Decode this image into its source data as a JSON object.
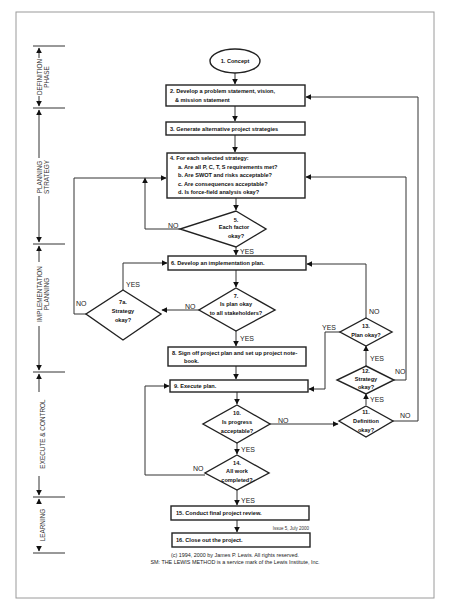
{
  "diagram": {
    "type": "flowchart",
    "phases": [
      {
        "id": "definition",
        "lines": [
          "DEFINITION",
          "PHASE"
        ]
      },
      {
        "id": "planning-strategy",
        "lines": [
          "PLANNING",
          "STRATEGY"
        ]
      },
      {
        "id": "implementation-planning",
        "lines": [
          "IMPLEMENTATION",
          "PLANNING"
        ]
      },
      {
        "id": "execute-control",
        "lines": [
          "EXECUTE & CONTROL"
        ]
      },
      {
        "id": "learning",
        "lines": [
          "LEARNING"
        ]
      }
    ],
    "nodes": {
      "n1": {
        "shape": "ellipse",
        "text": "1. Concept"
      },
      "n2": {
        "shape": "rect",
        "lines": [
          "2. Develop a problem statement, vision,",
          "& mission  statement"
        ]
      },
      "n3": {
        "shape": "rect",
        "lines": [
          "3. Generate alternative project strategies"
        ]
      },
      "n4": {
        "shape": "rect",
        "lines": [
          "4. For each selected strategy:",
          "a. Are all P, C, T, S requirements met?",
          "b. Are SWOT and risks acceptable?",
          "c. Are consequences acceptable?",
          "d. Is force-field analysis okay?"
        ]
      },
      "n5": {
        "shape": "diamond",
        "lines": [
          "5.",
          "Each factor",
          "okay?"
        ]
      },
      "n6": {
        "shape": "rect",
        "lines": [
          "6. Develop an implementation plan."
        ]
      },
      "n7": {
        "shape": "diamond",
        "lines": [
          "7.",
          "Is  plan okay",
          "to all stakeholders?"
        ]
      },
      "n7a": {
        "shape": "diamond",
        "lines": [
          "7a.",
          "Strategy",
          "okay?"
        ]
      },
      "n8": {
        "shape": "rect",
        "lines": [
          "8. Sign off project plan and set up project note-",
          "book."
        ]
      },
      "n9": {
        "shape": "rect",
        "lines": [
          "9. Execute plan."
        ]
      },
      "n10": {
        "shape": "diamond",
        "lines": [
          "10.",
          "Is progress",
          "acceptable?"
        ]
      },
      "n11": {
        "shape": "diamond",
        "lines": [
          "11.",
          "Definition",
          "okay?"
        ]
      },
      "n12": {
        "shape": "diamond",
        "lines": [
          "12.",
          "Strategy",
          "okay?"
        ]
      },
      "n13": {
        "shape": "diamond",
        "lines": [
          "13.",
          "Plan okay?"
        ]
      },
      "n14": {
        "shape": "diamond",
        "lines": [
          "14.",
          "All work",
          "completed?"
        ]
      },
      "n15": {
        "shape": "rect",
        "lines": [
          "15. Conduct final project review."
        ]
      },
      "n16": {
        "shape": "rect",
        "lines": [
          "16. Close out the project."
        ]
      }
    },
    "edge_labels": {
      "yes": "YES",
      "no": "NO"
    },
    "edges": [
      {
        "from": "n1",
        "to": "n2"
      },
      {
        "from": "n2",
        "to": "n3"
      },
      {
        "from": "n3",
        "to": "n4"
      },
      {
        "from": "n4",
        "to": "n5"
      },
      {
        "from": "n5",
        "to": "n6",
        "label": "YES"
      },
      {
        "from": "n5",
        "to": "n4",
        "label": "NO"
      },
      {
        "from": "n6",
        "to": "n7"
      },
      {
        "from": "n7",
        "to": "n8",
        "label": "YES"
      },
      {
        "from": "n7",
        "to": "n7a",
        "label": "NO"
      },
      {
        "from": "n7a",
        "to": "n6",
        "label": "YES"
      },
      {
        "from": "n7a",
        "to": "n4",
        "label": "NO"
      },
      {
        "from": "n8",
        "to": "n9"
      },
      {
        "from": "n9",
        "to": "n10"
      },
      {
        "from": "n10",
        "to": "n14",
        "label": "YES"
      },
      {
        "from": "n10",
        "to": "n11",
        "label": "NO"
      },
      {
        "from": "n11",
        "to": "n12",
        "label": "YES"
      },
      {
        "from": "n11",
        "to": "n2",
        "label": "NO"
      },
      {
        "from": "n12",
        "to": "n13",
        "label": "YES"
      },
      {
        "from": "n12",
        "to": "n4",
        "label": "NO"
      },
      {
        "from": "n13",
        "to": "n9",
        "label": "YES"
      },
      {
        "from": "n13",
        "to": "n6",
        "label": "NO"
      },
      {
        "from": "n14",
        "to": "n15",
        "label": "YES"
      },
      {
        "from": "n14",
        "to": "n9",
        "label": "NO"
      },
      {
        "from": "n15",
        "to": "n16"
      }
    ],
    "issue_note": "Issue 5, July 2000",
    "footer": {
      "copyright": "(c) 1994, 2000 by James P. Lewis. All rights reserved.",
      "service_mark": "SM: THE LEWIS METHOD is a service mark of the Lewis Institute, Inc."
    }
  }
}
